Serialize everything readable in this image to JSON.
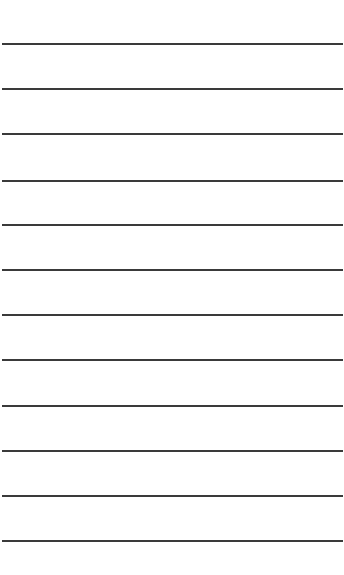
{
  "document": {
    "type": "lined-paper",
    "background_color": "#ffffff",
    "line_color": "#3a3a3a",
    "line_thickness_px": 2,
    "line_count": 12,
    "line_positions_y": [
      43,
      88,
      133,
      180,
      224,
      269,
      314,
      359,
      405,
      450,
      495,
      540
    ]
  }
}
